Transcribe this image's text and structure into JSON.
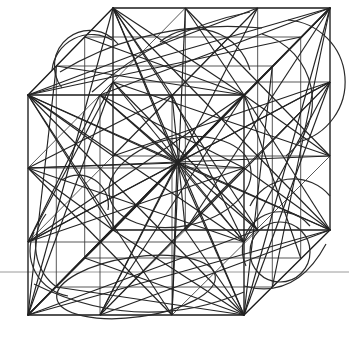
{
  "figure": {
    "type": "line-art-geometric-diagram",
    "projection": "oblique / cabinet projection",
    "background_color": "#ffffff",
    "stroke_color": "#1a1a1a",
    "grid_stroke_color": "#3a3a3a",
    "arc_stroke_color": "#2a2a2a",
    "reference_line_color": "#8f8f8f",
    "canvas": {
      "width": 349,
      "height": 340
    },
    "subdivision": 3,
    "cube": {
      "front_face": {
        "top_left": [
          28,
          95
        ],
        "top_right": [
          244,
          95
        ],
        "bottom_right": [
          244,
          315
        ],
        "bottom_left": [
          28,
          315
        ]
      },
      "back_face": {
        "top_left": [
          113,
          8
        ],
        "top_right": [
          330,
          8
        ],
        "bottom_right": [
          330,
          230
        ],
        "bottom_left": [
          113,
          230
        ]
      },
      "depth_offset": [
        85,
        -87
      ]
    },
    "reference_line": {
      "orientation": "horizontal",
      "y": 272,
      "x_start": 0,
      "x_end": 349
    },
    "hub_point": [
      177,
      163
    ]
  }
}
